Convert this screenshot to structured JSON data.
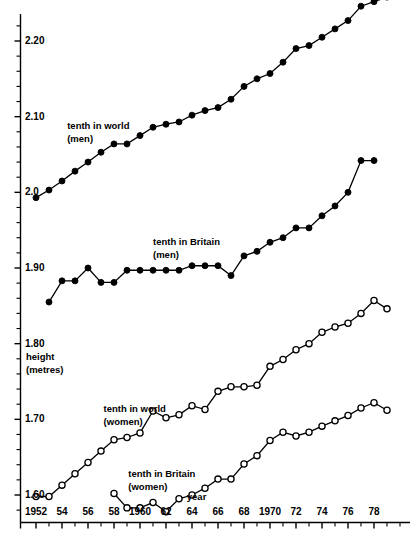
{
  "chart_data": {
    "type": "line",
    "title": "",
    "xlabel": "year",
    "ylabel": "height (metres)",
    "ylabel_line1": "height",
    "ylabel_line2": "(metres)",
    "xlim": [
      1951,
      1980
    ],
    "ylim": [
      1.56,
      2.29
    ],
    "grid": false,
    "legend_position": "inline-annotations",
    "y_ticks_major": [
      1.6,
      1.7,
      1.8,
      1.9,
      2.0,
      2.1,
      2.2
    ],
    "y_tick_labels": [
      "1.60",
      "1.70",
      "1.80",
      "1.90",
      "2.0",
      "2.10",
      "2.20"
    ],
    "y_tick_minor_step": 0.02,
    "x_ticks_major": [
      1952,
      1954,
      1956,
      1958,
      1960,
      1962,
      1964,
      1966,
      1968,
      1970,
      1972,
      1974,
      1976,
      1978
    ],
    "x_tick_labels": [
      "1952",
      "54",
      "56",
      "58",
      "1960",
      "62",
      "64",
      "66",
      "68",
      "1970",
      "72",
      "74",
      "76",
      "78"
    ],
    "x_tick_minor_step": 1,
    "marker_filled_color": "#000000",
    "marker_open_fill": "#ffffff",
    "line_color": "#000000",
    "axis_color": "#000000",
    "series": [
      {
        "name": "tenth in world (men)",
        "label_line1": "tenth in world",
        "label_line2": "(men)",
        "marker": "filled-circle",
        "label_x": 1954.4,
        "label_y": 2.088,
        "x": [
          1952,
          1953,
          1954,
          1955,
          1956,
          1957,
          1958,
          1959,
          1960,
          1961,
          1962,
          1963,
          1964,
          1965,
          1966,
          1967,
          1968,
          1969,
          1970,
          1971,
          1972,
          1973,
          1974,
          1975,
          1976,
          1977,
          1978,
          1979
        ],
        "y": [
          1.993,
          2.003,
          2.015,
          2.028,
          2.04,
          2.053,
          2.064,
          2.064,
          2.075,
          2.086,
          2.09,
          2.093,
          2.102,
          2.108,
          2.112,
          2.123,
          2.14,
          2.15,
          2.157,
          2.172,
          2.19,
          2.194,
          2.205,
          2.216,
          2.227,
          2.246,
          2.252,
          2.258
        ]
      },
      {
        "name": "tenth in Britain (men)",
        "label_line1": "tenth in Britain",
        "label_line2": "(men)",
        "marker": "filled-circle",
        "label_x": 1961.0,
        "label_y": 1.935,
        "x": [
          1953,
          1954,
          1955,
          1956,
          1957,
          1958,
          1959,
          1960,
          1961,
          1962,
          1963,
          1964,
          1965,
          1966,
          1967,
          1968,
          1969,
          1970,
          1971,
          1972,
          1973,
          1974,
          1975,
          1976,
          1977,
          1978
        ],
        "y": [
          1.855,
          1.883,
          1.883,
          1.9,
          1.881,
          1.881,
          1.897,
          1.897,
          1.897,
          1.897,
          1.897,
          1.903,
          1.903,
          1.903,
          1.89,
          1.916,
          1.922,
          1.934,
          1.94,
          1.953,
          1.953,
          1.969,
          1.982,
          2.0,
          2.042,
          2.042
        ]
      },
      {
        "name": "tenth in world (women)",
        "label_line1": "tenth in world",
        "label_line2": "(women)",
        "marker": "open-circle",
        "label_x": 1957.2,
        "label_y": 1.713,
        "x": [
          1952,
          1953,
          1954,
          1955,
          1956,
          1957,
          1958,
          1959,
          1960,
          1961,
          1962,
          1963,
          1964,
          1965,
          1966,
          1967,
          1968,
          1969,
          1970,
          1971,
          1972,
          1973,
          1974,
          1975,
          1976,
          1977,
          1978,
          1979
        ],
        "y": [
          1.598,
          1.598,
          1.613,
          1.628,
          1.643,
          1.658,
          1.673,
          1.676,
          1.682,
          1.711,
          1.702,
          1.706,
          1.718,
          1.713,
          1.737,
          1.743,
          1.743,
          1.745,
          1.77,
          1.779,
          1.792,
          1.8,
          1.815,
          1.822,
          1.827,
          1.84,
          1.857,
          1.846
        ]
      },
      {
        "name": "tenth in Britain (women)",
        "label_line1": "tenth in Britain",
        "label_line2": "(women)",
        "marker": "open-circle",
        "label_x": 1959.1,
        "label_y": 1.628,
        "x": [
          1958,
          1959,
          1960,
          1961,
          1962,
          1963,
          1964,
          1965,
          1966,
          1967,
          1968,
          1969,
          1970,
          1971,
          1972,
          1973,
          1974,
          1975,
          1976,
          1977,
          1978,
          1979
        ],
        "y": [
          1.602,
          1.583,
          1.583,
          1.59,
          1.578,
          1.595,
          1.6,
          1.609,
          1.621,
          1.621,
          1.641,
          1.652,
          1.672,
          1.683,
          1.678,
          1.683,
          1.691,
          1.698,
          1.705,
          1.715,
          1.722,
          1.712
        ]
      }
    ]
  }
}
